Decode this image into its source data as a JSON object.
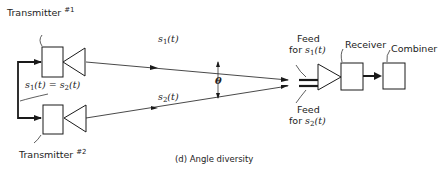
{
  "caption": "(d) Angle diversity",
  "transmitters": [
    {
      "label": "Transmitter",
      "number": "#1"
    },
    {
      "label": "Transmitter",
      "number": "#2"
    }
  ],
  "signal_equation": {
    "lhs": "s",
    "lhs_sub": "1",
    "lhs_arg": "(t)",
    "eq": "=",
    "rhs": "s",
    "rhs_sub": "2",
    "rhs_arg": "(t)"
  },
  "beams": [
    {
      "symbol": "s",
      "sub": "1",
      "arg": "(t)"
    },
    {
      "symbol": "s",
      "sub": "2",
      "arg": "(t)"
    }
  ],
  "angle_label": "θ",
  "feeds": [
    {
      "line1": "Feed",
      "line2": "for",
      "symbol": "s",
      "sub": "1",
      "arg": "(t)"
    },
    {
      "line1": "Feed",
      "line2": "for",
      "symbol": "s",
      "sub": "2",
      "arg": "(t)"
    }
  ],
  "receiver_label": "Receiver",
  "combiner_label": "Combiner",
  "colors": {
    "line": "#1a1a1a",
    "background": "#ffffff"
  }
}
